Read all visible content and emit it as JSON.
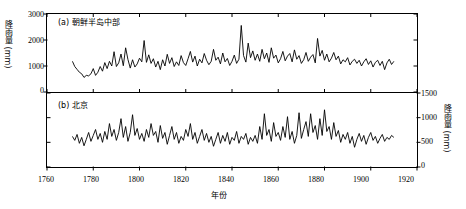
{
  "chart_data": [
    {
      "type": "line",
      "panel": "a",
      "title": "(a) 朝鲜半岛中部",
      "xlabel": "年份",
      "ylabel": "降雨量 (mm)",
      "xlim": [
        1760,
        1920
      ],
      "ylim": [
        0,
        3000
      ],
      "xticks": [
        1760,
        1780,
        1800,
        1820,
        1840,
        1860,
        1880,
        1900,
        1920
      ],
      "yticks": [
        0,
        1000,
        2000,
        3000
      ],
      "axis_side": "left",
      "grid": false,
      "legend": "none",
      "line_color": "#000000",
      "x": [
        1771,
        1772,
        1773,
        1774,
        1775,
        1776,
        1777,
        1778,
        1779,
        1780,
        1781,
        1782,
        1783,
        1784,
        1785,
        1786,
        1787,
        1788,
        1789,
        1790,
        1791,
        1792,
        1793,
        1794,
        1795,
        1796,
        1797,
        1798,
        1799,
        1800,
        1801,
        1802,
        1803,
        1804,
        1805,
        1806,
        1807,
        1808,
        1809,
        1810,
        1811,
        1812,
        1813,
        1814,
        1815,
        1816,
        1817,
        1818,
        1819,
        1820,
        1821,
        1822,
        1823,
        1824,
        1825,
        1826,
        1827,
        1828,
        1829,
        1830,
        1831,
        1832,
        1833,
        1834,
        1835,
        1836,
        1837,
        1838,
        1839,
        1840,
        1841,
        1842,
        1843,
        1844,
        1845,
        1846,
        1847,
        1848,
        1849,
        1850,
        1851,
        1852,
        1853,
        1854,
        1855,
        1856,
        1857,
        1858,
        1859,
        1860,
        1861,
        1862,
        1863,
        1864,
        1865,
        1866,
        1867,
        1868,
        1869,
        1870,
        1871,
        1872,
        1873,
        1874,
        1875,
        1876,
        1877,
        1878,
        1879,
        1880,
        1881,
        1882,
        1883,
        1884,
        1885,
        1886,
        1887,
        1888,
        1889,
        1890,
        1891,
        1892,
        1893,
        1894,
        1895,
        1896,
        1897,
        1898,
        1899,
        1900,
        1901,
        1902,
        1903,
        1904,
        1905,
        1906,
        1907,
        1908,
        1909,
        1910
      ],
      "y": [
        1180,
        980,
        870,
        760,
        700,
        560,
        640,
        620,
        700,
        900,
        640,
        760,
        980,
        800,
        1130,
        900,
        1180,
        1000,
        1550,
        980,
        1120,
        1460,
        1010,
        1700,
        1250,
        920,
        1240,
        960,
        1080,
        1300,
        1160,
        1980,
        1140,
        1430,
        1100,
        1280,
        960,
        1180,
        860,
        1240,
        1000,
        1450,
        1100,
        1320,
        980,
        1160,
        1020,
        1400,
        1130,
        1020,
        1280,
        1560,
        1150,
        1380,
        1000,
        1260,
        1120,
        1480,
        1220,
        1050,
        1180,
        1640,
        1220,
        1340,
        1080,
        1500,
        1160,
        1290,
        1020,
        1180,
        1420,
        1100,
        1260,
        2560,
        1400,
        1150,
        1880,
        1320,
        1580,
        1220,
        1460,
        1180,
        1640,
        1280,
        1500,
        1140,
        1700,
        1300,
        1420,
        1120,
        1280,
        1560,
        1200,
        1380,
        1480,
        1160,
        1620,
        1260,
        1400,
        1100,
        1240,
        1520,
        1180,
        1340,
        1440,
        1120,
        2060,
        1380,
        1600,
        1220,
        1460,
        1160,
        1300,
        1520,
        1240,
        1380,
        1080,
        1240,
        1160,
        1320,
        1040,
        1180,
        1260,
        1100,
        1220,
        1000,
        1160,
        1280,
        1060,
        1200,
        960,
        1140,
        1220,
        1020,
        1180,
        860,
        1120,
        1260,
        1060,
        1180
      ]
    },
    {
      "type": "line",
      "panel": "b",
      "title": "(b) 北京",
      "xlabel": "年份",
      "ylabel": "降雨量 (mm)",
      "xlim": [
        1760,
        1920
      ],
      "ylim": [
        0,
        1500
      ],
      "xticks": [
        1760,
        1780,
        1800,
        1820,
        1840,
        1860,
        1880,
        1900,
        1920
      ],
      "yticks": [
        0,
        500,
        1000,
        1500
      ],
      "axis_side": "right",
      "grid": false,
      "legend": "none",
      "line_color": "#000000",
      "x": [
        1771,
        1772,
        1773,
        1774,
        1775,
        1776,
        1777,
        1778,
        1779,
        1780,
        1781,
        1782,
        1783,
        1784,
        1785,
        1786,
        1787,
        1788,
        1789,
        1790,
        1791,
        1792,
        1793,
        1794,
        1795,
        1796,
        1797,
        1798,
        1799,
        1800,
        1801,
        1802,
        1803,
        1804,
        1805,
        1806,
        1807,
        1808,
        1809,
        1810,
        1811,
        1812,
        1813,
        1814,
        1815,
        1816,
        1817,
        1818,
        1819,
        1820,
        1821,
        1822,
        1823,
        1824,
        1825,
        1826,
        1827,
        1828,
        1829,
        1830,
        1831,
        1832,
        1833,
        1834,
        1835,
        1836,
        1837,
        1838,
        1839,
        1840,
        1841,
        1842,
        1843,
        1844,
        1845,
        1846,
        1847,
        1848,
        1849,
        1850,
        1851,
        1852,
        1853,
        1854,
        1855,
        1856,
        1857,
        1858,
        1859,
        1860,
        1861,
        1862,
        1863,
        1864,
        1865,
        1866,
        1867,
        1868,
        1869,
        1870,
        1871,
        1872,
        1873,
        1874,
        1875,
        1876,
        1877,
        1878,
        1879,
        1880,
        1881,
        1882,
        1883,
        1884,
        1885,
        1886,
        1887,
        1888,
        1889,
        1890,
        1891,
        1892,
        1893,
        1894,
        1895,
        1896,
        1897,
        1898,
        1899,
        1900,
        1901,
        1902,
        1903,
        1904,
        1905,
        1906,
        1907,
        1908,
        1909,
        1910
      ],
      "y": [
        620,
        540,
        660,
        480,
        600,
        430,
        560,
        700,
        520,
        640,
        760,
        560,
        680,
        500,
        720,
        560,
        880,
        620,
        760,
        540,
        700,
        980,
        600,
        820,
        520,
        700,
        1060,
        640,
        780,
        560,
        680,
        520,
        760,
        600,
        880,
        640,
        720,
        500,
        840,
        580,
        700,
        460,
        640,
        820,
        560,
        700,
        480,
        620,
        540,
        760,
        620,
        880,
        560,
        700,
        480,
        620,
        760,
        540,
        680,
        500,
        620,
        420,
        560,
        700,
        480,
        640,
        520,
        700,
        460,
        600,
        540,
        720,
        480,
        620,
        560,
        680,
        460,
        600,
        520,
        640,
        480,
        820,
        560,
        1080,
        640,
        760,
        520,
        900,
        620,
        700,
        540,
        820,
        600,
        1020,
        560,
        720,
        480,
        640,
        1100,
        580,
        760,
        920,
        620,
        1080,
        700,
        840,
        560,
        980,
        640,
        1160,
        720,
        820,
        560,
        900,
        620,
        740,
        500,
        660,
        560,
        700,
        480,
        620,
        400,
        560,
        680,
        520,
        640,
        460,
        600,
        700,
        540,
        620,
        480,
        580,
        660,
        520,
        600,
        560,
        640,
        600
      ]
    }
  ],
  "panels": {
    "a": {
      "label": "(a) 朝鲜半岛中部"
    },
    "b": {
      "label": "(b) 北京"
    }
  },
  "axes": {
    "x_name": "年份",
    "y_left_name": "降雨量 (mm)",
    "y_right_name": "降雨量 (mm)",
    "x_ticks": [
      "1760",
      "1780",
      "1800",
      "1820",
      "1840",
      "1860",
      "1880",
      "1900",
      "1920"
    ],
    "y_left_ticks": [
      "3000",
      "2000",
      "1000",
      "0"
    ],
    "y_right_ticks": [
      "1500",
      "1000",
      "500",
      "0"
    ]
  },
  "style": {
    "line_color": "#000000",
    "axis_color": "#000000",
    "background": "#ffffff"
  }
}
